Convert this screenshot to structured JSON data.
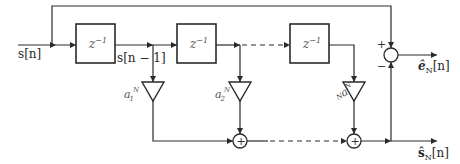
{
  "diagram": {
    "title": "",
    "input": {
      "label": "s[n]"
    },
    "delay_blocks": [
      {
        "label": "z",
        "exponent": "−1"
      },
      {
        "label": "z",
        "exponent": "−1"
      },
      {
        "label": "z",
        "exponent": "−1"
      }
    ],
    "tap_labels": [
      {
        "label": "s[n − 1]"
      }
    ],
    "coefficients": [
      {
        "base": "a",
        "subscript": "1",
        "superscript": "N"
      },
      {
        "base": "a",
        "subscript": "2",
        "superscript": "N"
      },
      {
        "base": "a",
        "subscript": "N",
        "superscript": "N"
      }
    ],
    "summer_signs": {
      "plus": "+",
      "minus": "−"
    },
    "adders": [
      {
        "symbol": "+"
      },
      {
        "symbol": "+"
      }
    ],
    "outputs": {
      "error": {
        "label": "ê",
        "subscript": "N",
        "suffix": "[n]"
      },
      "estimate": {
        "label": "ŝ",
        "subscript": "N",
        "suffix": "[n]"
      }
    }
  }
}
